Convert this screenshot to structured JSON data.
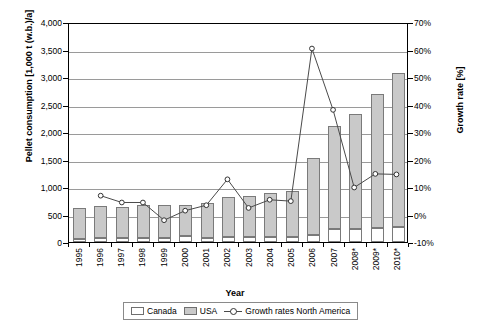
{
  "chart_data": {
    "type": "bar",
    "title": "",
    "xlabel": "Year",
    "ylabel": "Pellet consumption [1,000 t (w.b.)/a]",
    "y2label": "Growth rate [%]",
    "categories": [
      "1995",
      "1996",
      "1997",
      "1998",
      "1999",
      "2000",
      "2001",
      "2002",
      "2003",
      "2004",
      "2005",
      "2006",
      "2007",
      "2008*",
      "2009*",
      "2010*"
    ],
    "ylim": [
      0,
      4000
    ],
    "yticks": [
      "0",
      "500",
      "1,000",
      "1,500",
      "2,000",
      "2,500",
      "3,000",
      "3,500",
      "4,000"
    ],
    "ytick_values": [
      0,
      500,
      1000,
      1500,
      2000,
      2500,
      3000,
      3500,
      4000
    ],
    "y2lim": [
      -10,
      70
    ],
    "y2ticks": [
      "-10%",
      "0%",
      "10%",
      "20%",
      "30%",
      "40%",
      "50%",
      "60%",
      "70%"
    ],
    "y2tick_values": [
      -10,
      0,
      10,
      20,
      30,
      40,
      50,
      60,
      70
    ],
    "grid": true,
    "legend_position": "bottom",
    "series": [
      {
        "name": "Canada",
        "type": "bar-stack",
        "color": "#ffffff",
        "values": [
          50,
          70,
          75,
          80,
          75,
          115,
          80,
          95,
          85,
          85,
          85,
          120,
          240,
          240,
          260,
          275
        ]
      },
      {
        "name": "USA",
        "type": "bar-stack",
        "color": "#c9c9c9",
        "values": [
          565,
          580,
          565,
          585,
          590,
          560,
          635,
          725,
          755,
          800,
          850,
          1400,
          1870,
          2085,
          2425,
          2805
        ]
      },
      {
        "name": "Growth rates North America",
        "type": "line",
        "axis": "right",
        "color": "#4a4a4a",
        "values": [
          null,
          7.0,
          4.5,
          4.5,
          -2.0,
          1.5,
          3.5,
          13.0,
          2.5,
          5.5,
          5.0,
          61.0,
          38.5,
          10.0,
          15.0,
          14.8
        ]
      }
    ],
    "totals": [
      615,
      650,
      640,
      665,
      665,
      675,
      715,
      820,
      840,
      885,
      935,
      1520,
      2110,
      2325,
      2685,
      3080
    ]
  },
  "legend": {
    "items": [
      {
        "label": "Canada",
        "marker": "white-square"
      },
      {
        "label": "USA",
        "marker": "gray-square"
      },
      {
        "label": "Growth rates North America",
        "marker": "line-circle"
      }
    ]
  }
}
